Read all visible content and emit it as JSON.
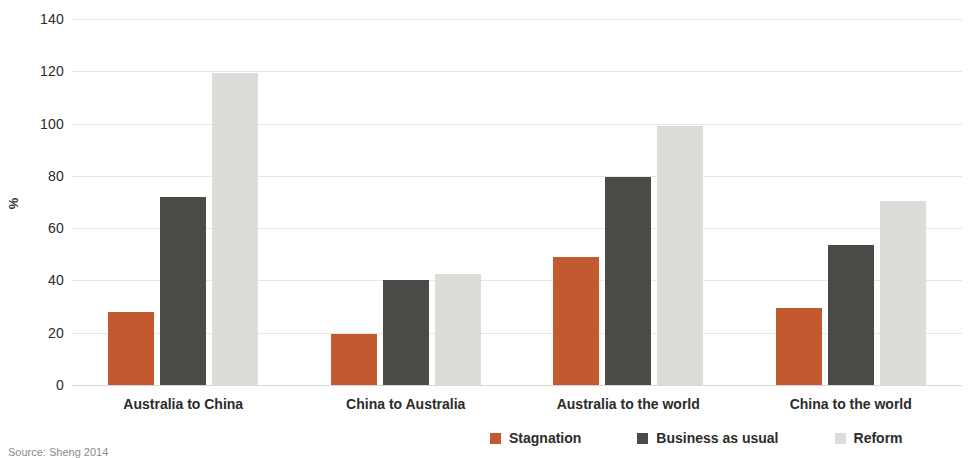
{
  "chart_data": {
    "type": "bar",
    "title": "",
    "xlabel": "",
    "ylabel": "%",
    "ylim": [
      0,
      140
    ],
    "yticks": [
      0,
      20,
      40,
      60,
      80,
      100,
      120,
      140
    ],
    "grid": true,
    "legend_position": "bottom-right",
    "categories": [
      "Australia to China",
      "China to Australia",
      "Australia to the world",
      "China to the world"
    ],
    "series": [
      {
        "name": "Stagnation",
        "color": "#c2592f",
        "values": [
          28,
          19.5,
          49,
          29.5
        ]
      },
      {
        "name": "Business as usual",
        "color": "#4a4a47",
        "values": [
          72,
          40,
          79.5,
          53.5
        ]
      },
      {
        "name": "Reform",
        "color": "#dcdcd9",
        "values": [
          119.5,
          42.5,
          99,
          70.5
        ]
      }
    ]
  },
  "axis": {
    "y_title": "%",
    "y_tick_labels": [
      "140",
      "120",
      "100",
      "80",
      "60",
      "40",
      "20",
      "0"
    ]
  },
  "legend": {
    "items": [
      {
        "label": "Stagnation"
      },
      {
        "label": "Business as usual"
      },
      {
        "label": "Reform"
      }
    ]
  },
  "footer": {
    "source": "Source: Sheng 2014"
  }
}
